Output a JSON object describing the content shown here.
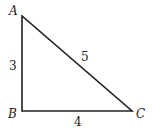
{
  "diagram": {
    "type": "right-triangle",
    "vertices": {
      "A": "A",
      "B": "B",
      "C": "C"
    },
    "sides": {
      "AB": "3",
      "BC": "4",
      "AC": "5"
    },
    "stroke_color": "#222222"
  }
}
